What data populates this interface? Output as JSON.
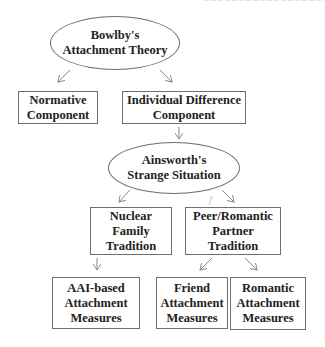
{
  "header_fragment": {
    "text": "",
    "note": "clipped at top edge; illegible"
  },
  "diagram": {
    "type": "hierarchy",
    "nodes": {
      "bowlby": {
        "label": "Bowlby's\nAttachment Theory",
        "shape": "ellipse"
      },
      "normative": {
        "label": "Normative\nComponent",
        "shape": "box"
      },
      "individual": {
        "label": "Individual Difference\nComponent",
        "shape": "box"
      },
      "ainsworth": {
        "label": "Ainsworth's\nStrange Situation",
        "shape": "ellipse"
      },
      "nuclear": {
        "label": "Nuclear\nFamily\nTradition",
        "shape": "box"
      },
      "peer": {
        "label": "Peer/Romantic\nPartner\nTradition",
        "shape": "box"
      },
      "aai": {
        "label": "AAI-based\nAttachment\nMeasures",
        "shape": "box"
      },
      "friend": {
        "label": "Friend\nAttachment\nMeasures",
        "shape": "box"
      },
      "romantic": {
        "label": "Romantic\nAttachment\nMeasures",
        "shape": "box"
      }
    },
    "edges": [
      {
        "from": "bowlby",
        "to": "normative"
      },
      {
        "from": "bowlby",
        "to": "individual"
      },
      {
        "from": "individual",
        "to": "ainsworth"
      },
      {
        "from": "ainsworth",
        "to": "nuclear"
      },
      {
        "from": "ainsworth",
        "to": "peer"
      },
      {
        "from": "nuclear",
        "to": "aai"
      },
      {
        "from": "peer",
        "to": "friend"
      },
      {
        "from": "peer",
        "to": "romantic"
      }
    ],
    "uncertain_marks": [
      {
        "location": "near top of Peer/Romantic box, x≈210 y≈196-205",
        "note": "faint short stroke; artifact or partial arrow — undetermined"
      }
    ]
  },
  "colors": {
    "background": "#ffffff",
    "border": "#6e6e6e",
    "arrow": "#8a8a8a",
    "text": "#222222"
  }
}
